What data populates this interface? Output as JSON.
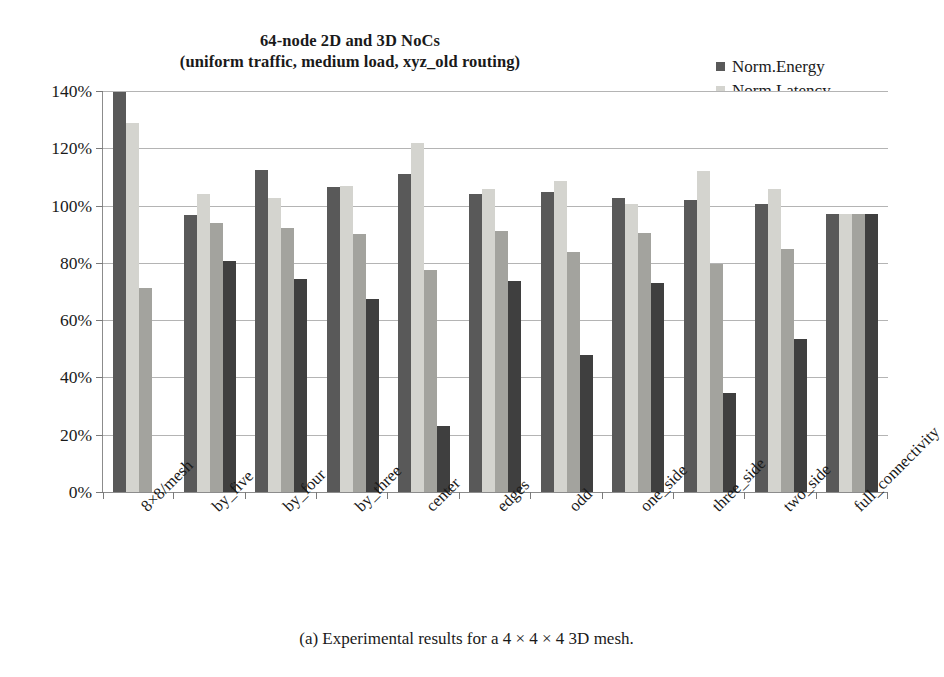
{
  "figure": {
    "title_lines": [
      "64-node 2D and 3D NoCs",
      "(uniform traffic, medium load, xyz_old routing)"
    ],
    "caption": "(a) Experimental results for a 4 × 4 × 4 3D mesh."
  },
  "legend": {
    "position": "top-right",
    "items": [
      {
        "label": "Norm.Energy",
        "color": "#595959"
      },
      {
        "label": "Norm.Latency",
        "color": "#d4d4cf"
      },
      {
        "label": "Norm.Area",
        "color": "#a3a39e"
      },
      {
        "label": "#Links",
        "color": "#3f3f3f"
      }
    ]
  },
  "chart_data": {
    "type": "bar",
    "title": "64-node 2D and 3D NoCs (uniform traffic, medium load, xyz_old routing)",
    "xlabel": "",
    "ylabel": "",
    "ylim": [
      0,
      140
    ],
    "ytick_labels": [
      "0%",
      "20%",
      "40%",
      "60%",
      "80%",
      "100%",
      "120%",
      "140%"
    ],
    "ytick_values": [
      0,
      20,
      40,
      60,
      80,
      100,
      120,
      140
    ],
    "grid": true,
    "categories": [
      "8×8/mesh",
      "by_five",
      "by_four",
      "by_three",
      "center",
      "edges",
      "odd",
      "one_side",
      "three_side",
      "two_side",
      "full_connectivity"
    ],
    "series": [
      {
        "name": "Norm.Energy",
        "color": "#595959",
        "values": [
          139.5,
          96.8,
          112.3,
          106.5,
          111.2,
          104.0,
          104.8,
          102.7,
          101.8,
          100.7,
          97.0
        ]
      },
      {
        "name": "Norm.Latency",
        "color": "#d4d4cf",
        "values": [
          128.8,
          104.0,
          102.6,
          107.0,
          121.8,
          105.9,
          108.6,
          100.5,
          112.0,
          105.7,
          97.0
        ]
      },
      {
        "name": "Norm.Area",
        "color": "#a3a39e",
        "values": [
          71.2,
          93.8,
          92.2,
          90.0,
          77.5,
          91.0,
          83.7,
          90.5,
          79.6,
          84.8,
          97.0
        ]
      },
      {
        "name": "#Links",
        "color": "#3f3f3f",
        "values": [
          0,
          80.6,
          74.3,
          67.5,
          23.0,
          73.5,
          47.7,
          72.8,
          34.6,
          53.4,
          97.0
        ]
      }
    ]
  }
}
